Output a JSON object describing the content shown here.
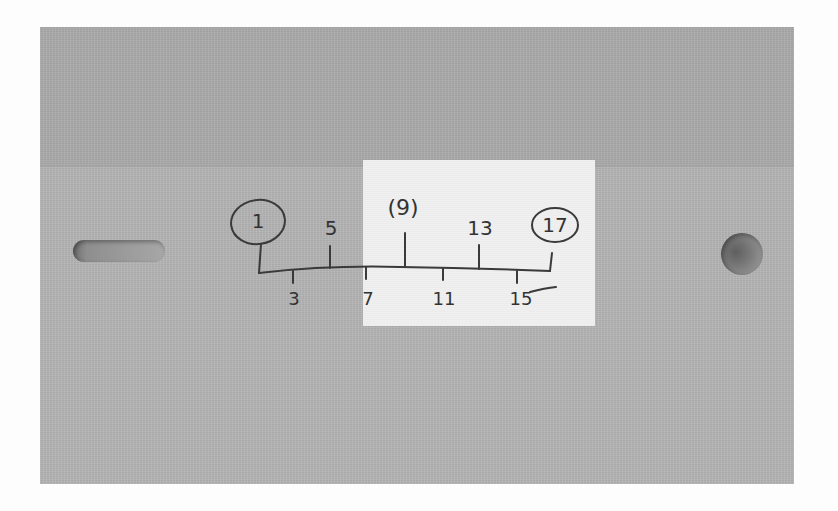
{
  "scene": {
    "description": "Photo of a gray paper card with a handwritten number line; a white rectangle highlights the middle section",
    "colors": {
      "card": "#b4b4b4",
      "card_top_flap": "#aaaaaa",
      "highlight": "#f0f0f0",
      "ink": "#3a3a3a",
      "background": "#fdfdfd"
    }
  },
  "number_line": {
    "upper_labels": [
      {
        "text": "1",
        "circled": true
      },
      {
        "text": "5",
        "circled": false
      },
      {
        "text": "(9)",
        "circled": false
      },
      {
        "text": "13",
        "circled": false
      },
      {
        "text": "17",
        "circled": true
      }
    ],
    "lower_labels": [
      {
        "text": "3"
      },
      {
        "text": "7"
      },
      {
        "text": "11"
      },
      {
        "text": "15"
      }
    ]
  },
  "card_features": {
    "left": "slot-hole",
    "right": "round-hole"
  }
}
